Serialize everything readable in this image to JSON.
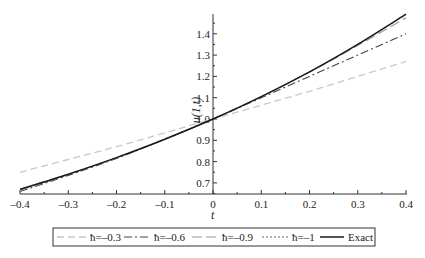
{
  "chart_data": {
    "type": "line",
    "title": "",
    "xlabel": "t",
    "ylabel": "u(1,t)",
    "xlim": [
      -0.4,
      0.4
    ],
    "ylim": [
      0.65,
      1.5
    ],
    "grid": false,
    "legend_position": "bottom",
    "x_ticks": [
      "-0.4",
      "-0.3",
      "-0.2",
      "-0.1",
      "0",
      "0.1",
      "0.2",
      "0.3",
      "0.4"
    ],
    "y_ticks": [
      "0.7",
      "0.8",
      "0.9",
      "1.0",
      "1.1",
      "1.2",
      "1.3",
      "1.4"
    ],
    "x": [
      -0.4,
      -0.3,
      -0.2,
      -0.1,
      0,
      0.1,
      0.2,
      0.3,
      0.4
    ],
    "series": [
      {
        "name": "ħ=-0.3",
        "style": "dashed-light",
        "values": [
          0.75,
          0.81,
          0.87,
          0.935,
          1.0,
          1.065,
          1.13,
          1.2,
          1.27
        ]
      },
      {
        "name": "ħ=-0.6",
        "style": "dash-dot",
        "values": [
          0.66,
          0.735,
          0.815,
          0.905,
          1.0,
          1.1,
          1.2,
          1.3,
          1.4
        ]
      },
      {
        "name": "ħ=-0.9",
        "style": "long-dash",
        "values": [
          0.665,
          0.74,
          0.818,
          0.905,
          1.0,
          1.105,
          1.22,
          1.345,
          1.475
        ]
      },
      {
        "name": "ħ=-1",
        "style": "dotted",
        "values": [
          0.67,
          0.741,
          0.819,
          0.905,
          1.0,
          1.105,
          1.221,
          1.35,
          1.49
        ]
      },
      {
        "name": "Exact",
        "style": "solid",
        "values": [
          0.67,
          0.741,
          0.819,
          0.905,
          1.0,
          1.105,
          1.221,
          1.35,
          1.492
        ]
      }
    ]
  },
  "legend": {
    "items": [
      "ħ=–0.3",
      "ħ=–0.6",
      "ħ=–0.9",
      "ħ=–1",
      "Exact"
    ]
  },
  "axes": {
    "xlabel": "t",
    "ylabel": "u(1,t)",
    "x_tick_labels": [
      "–0.4",
      "–0.3",
      "–0.2",
      "–0.1",
      "0",
      "0.1",
      "0.2",
      "0.3",
      "0.4"
    ],
    "y_tick_labels": [
      "0.7",
      "0.8",
      "0.9",
      "1.0",
      "1.1",
      "1.2",
      "1.3",
      "1.4"
    ]
  }
}
